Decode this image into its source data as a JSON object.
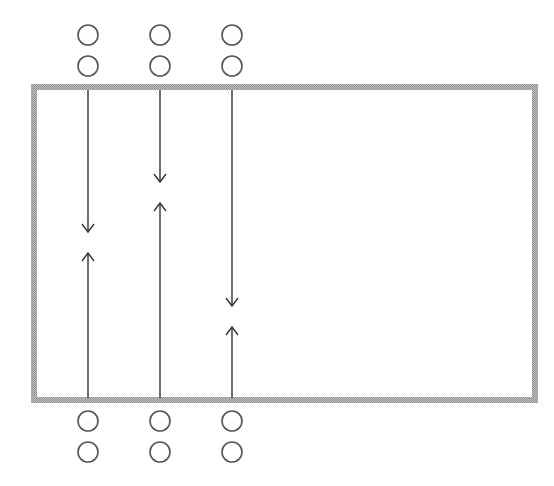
{
  "diagram": {
    "title_partially_visible": "",
    "box": {
      "x": 34,
      "y": 87,
      "width": 501,
      "height": 313,
      "stroke": "#a9a9a9",
      "stroke_width": 6
    },
    "circle": {
      "radius": 10,
      "stroke": "#555555",
      "stroke_width": 1.6
    },
    "line_color": "#333333",
    "columns": [
      {
        "id": "col-1",
        "x": 88,
        "top_circles_y": [
          35,
          66
        ],
        "bottom_circles_y": [
          421,
          452
        ],
        "down_arrow": {
          "from_y": 90,
          "tip_y": 232
        },
        "up_arrow": {
          "from_y": 398,
          "tip_y": 253
        }
      },
      {
        "id": "col-2",
        "x": 160,
        "top_circles_y": [
          35,
          66
        ],
        "bottom_circles_y": [
          421,
          452
        ],
        "down_arrow": {
          "from_y": 90,
          "tip_y": 182
        },
        "up_arrow": {
          "from_y": 398,
          "tip_y": 203
        }
      },
      {
        "id": "col-3",
        "x": 232,
        "top_circles_y": [
          35,
          66
        ],
        "bottom_circles_y": [
          421,
          452
        ],
        "down_arrow": {
          "from_y": 90,
          "tip_y": 306
        },
        "up_arrow": {
          "from_y": 398,
          "tip_y": 327
        }
      }
    ]
  }
}
